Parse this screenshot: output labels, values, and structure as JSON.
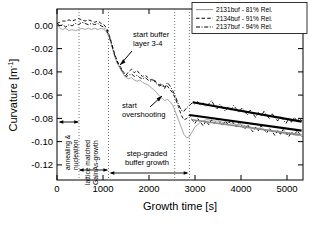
{
  "chart_data": {
    "type": "line",
    "title": "",
    "xlabel": "Growth time [s]",
    "ylabel": "Curvature [m-1]",
    "ylabel_base": "Curvature [m",
    "ylabel_sup": "-1",
    "ylabel_close": "]",
    "xlim": [
      0,
      5350
    ],
    "ylim": [
      -0.13,
      0.012
    ],
    "xticks": [
      0,
      1000,
      2000,
      3000,
      4000,
      5000
    ],
    "xtick_labels": [
      "0",
      "1000",
      "2000",
      "3000",
      "4000",
      "5000"
    ],
    "yticks": [
      0.0,
      -0.02,
      -0.04,
      -0.06,
      -0.08,
      -0.1,
      -0.12
    ],
    "ytick_labels": [
      "0.00",
      "-0.02",
      "-0.04",
      "-0.06",
      "-0.08",
      "-0.10",
      "-0.12"
    ],
    "grid": false,
    "legend_position": "top-right",
    "series": [
      {
        "name": "2131buf - 81% Rel.",
        "style": "solid",
        "color": "#9a9a9a",
        "width": 0.9,
        "points": [
          [
            0,
            0.0
          ],
          [
            60,
            -0.004
          ],
          [
            120,
            -0.005
          ],
          [
            190,
            -0.004
          ],
          [
            260,
            -0.006
          ],
          [
            330,
            -0.005
          ],
          [
            400,
            -0.006
          ],
          [
            470,
            -0.005
          ],
          [
            540,
            -0.004
          ],
          [
            610,
            -0.005
          ],
          [
            680,
            -0.004
          ],
          [
            750,
            -0.005
          ],
          [
            820,
            -0.004
          ],
          [
            890,
            -0.005
          ],
          [
            960,
            -0.004
          ],
          [
            1020,
            -0.005
          ],
          [
            1080,
            -0.007
          ],
          [
            1140,
            -0.012
          ],
          [
            1200,
            -0.02
          ],
          [
            1260,
            -0.028
          ],
          [
            1320,
            -0.034
          ],
          [
            1380,
            -0.038
          ],
          [
            1440,
            -0.042
          ],
          [
            1500,
            -0.045
          ],
          [
            1560,
            -0.046
          ],
          [
            1620,
            -0.045
          ],
          [
            1680,
            -0.047
          ],
          [
            1740,
            -0.048
          ],
          [
            1800,
            -0.047
          ],
          [
            1860,
            -0.049
          ],
          [
            1920,
            -0.05
          ],
          [
            1980,
            -0.051
          ],
          [
            2040,
            -0.053
          ],
          [
            2100,
            -0.055
          ],
          [
            2160,
            -0.057
          ],
          [
            2220,
            -0.06
          ],
          [
            2280,
            -0.062
          ],
          [
            2340,
            -0.064
          ],
          [
            2400,
            -0.063
          ],
          [
            2460,
            -0.065
          ],
          [
            2520,
            -0.068
          ],
          [
            2580,
            -0.074
          ],
          [
            2640,
            -0.08
          ],
          [
            2700,
            -0.086
          ],
          [
            2760,
            -0.092
          ],
          [
            2820,
            -0.095
          ],
          [
            2880,
            -0.094
          ],
          [
            2940,
            -0.09
          ],
          [
            3000,
            -0.086
          ],
          [
            3060,
            -0.084
          ],
          [
            3120,
            -0.082
          ],
          [
            3180,
            -0.081
          ],
          [
            3240,
            -0.08
          ],
          [
            3300,
            -0.08
          ],
          [
            3400,
            -0.081
          ],
          [
            3500,
            -0.081
          ],
          [
            3600,
            -0.082
          ],
          [
            3700,
            -0.082
          ],
          [
            3800,
            -0.083
          ],
          [
            3900,
            -0.084
          ],
          [
            4000,
            -0.084
          ],
          [
            4100,
            -0.085
          ],
          [
            4200,
            -0.086
          ],
          [
            4300,
            -0.087
          ],
          [
            4400,
            -0.087
          ],
          [
            4500,
            -0.088
          ],
          [
            4600,
            -0.089
          ],
          [
            4700,
            -0.09
          ],
          [
            4800,
            -0.09
          ],
          [
            4900,
            -0.091
          ],
          [
            5000,
            -0.092
          ],
          [
            5100,
            -0.092
          ],
          [
            5200,
            -0.093
          ],
          [
            5300,
            -0.093
          ]
        ]
      },
      {
        "name": "2134buf - 91% Rel.",
        "style": "dashed",
        "color": "#000000",
        "width": 0.9,
        "points": [
          [
            0,
            0.0
          ],
          [
            60,
            0.001
          ],
          [
            120,
            0.002
          ],
          [
            190,
            0.002
          ],
          [
            260,
            0.003
          ],
          [
            330,
            0.002
          ],
          [
            400,
            0.003
          ],
          [
            470,
            0.004
          ],
          [
            540,
            0.003
          ],
          [
            610,
            0.002
          ],
          [
            680,
            0.003
          ],
          [
            750,
            0.002
          ],
          [
            820,
            0.001
          ],
          [
            890,
            0.002
          ],
          [
            960,
            0.0
          ],
          [
            1020,
            -0.001
          ],
          [
            1080,
            -0.004
          ],
          [
            1140,
            -0.01
          ],
          [
            1200,
            -0.018
          ],
          [
            1260,
            -0.026
          ],
          [
            1320,
            -0.032
          ],
          [
            1380,
            -0.036
          ],
          [
            1440,
            -0.04
          ],
          [
            1500,
            -0.043
          ],
          [
            1560,
            -0.04
          ],
          [
            1620,
            -0.038
          ],
          [
            1680,
            -0.041
          ],
          [
            1740,
            -0.039
          ],
          [
            1800,
            -0.042
          ],
          [
            1860,
            -0.044
          ],
          [
            1920,
            -0.043
          ],
          [
            1980,
            -0.045
          ],
          [
            2040,
            -0.047
          ],
          [
            2100,
            -0.046
          ],
          [
            2160,
            -0.049
          ],
          [
            2220,
            -0.051
          ],
          [
            2280,
            -0.05
          ],
          [
            2340,
            -0.053
          ],
          [
            2400,
            -0.052
          ],
          [
            2460,
            -0.055
          ],
          [
            2520,
            -0.058
          ],
          [
            2580,
            -0.063
          ],
          [
            2640,
            -0.069
          ],
          [
            2700,
            -0.076
          ],
          [
            2760,
            -0.08
          ],
          [
            2820,
            -0.079
          ],
          [
            2880,
            -0.076
          ],
          [
            2940,
            -0.08
          ],
          [
            3000,
            -0.083
          ],
          [
            3060,
            -0.079
          ],
          [
            3120,
            -0.082
          ],
          [
            3180,
            -0.085
          ],
          [
            3240,
            -0.081
          ],
          [
            3300,
            -0.084
          ],
          [
            3360,
            -0.08
          ],
          [
            3420,
            -0.083
          ],
          [
            3480,
            -0.079
          ],
          [
            3540,
            -0.082
          ],
          [
            3600,
            -0.085
          ],
          [
            3660,
            -0.081
          ],
          [
            3720,
            -0.084
          ],
          [
            3780,
            -0.08
          ],
          [
            3840,
            -0.083
          ],
          [
            3900,
            -0.086
          ],
          [
            3960,
            -0.082
          ],
          [
            4020,
            -0.085
          ],
          [
            4080,
            -0.088
          ],
          [
            4140,
            -0.084
          ],
          [
            4200,
            -0.087
          ],
          [
            4260,
            -0.09
          ],
          [
            4320,
            -0.086
          ],
          [
            4380,
            -0.089
          ],
          [
            4440,
            -0.085
          ],
          [
            4500,
            -0.088
          ],
          [
            4560,
            -0.091
          ],
          [
            4620,
            -0.087
          ],
          [
            4680,
            -0.09
          ],
          [
            4740,
            -0.093
          ],
          [
            4800,
            -0.089
          ],
          [
            4860,
            -0.092
          ],
          [
            4920,
            -0.088
          ],
          [
            4980,
            -0.091
          ],
          [
            5040,
            -0.094
          ],
          [
            5100,
            -0.09
          ],
          [
            5160,
            -0.093
          ],
          [
            5220,
            -0.089
          ],
          [
            5280,
            -0.092
          ],
          [
            5330,
            -0.094
          ]
        ]
      },
      {
        "name": "2137buf - 94% Rel.",
        "style": "dashdot",
        "color": "#000000",
        "width": 0.9,
        "points": [
          [
            0,
            0.0
          ],
          [
            60,
            -0.002
          ],
          [
            120,
            -0.001
          ],
          [
            190,
            -0.003
          ],
          [
            260,
            -0.001
          ],
          [
            330,
            -0.002
          ],
          [
            400,
            0.0
          ],
          [
            470,
            -0.001
          ],
          [
            540,
            0.001
          ],
          [
            610,
            0.0
          ],
          [
            680,
            -0.001
          ],
          [
            750,
            0.0
          ],
          [
            820,
            -0.001
          ],
          [
            890,
            0.0
          ],
          [
            960,
            -0.002
          ],
          [
            1020,
            -0.003
          ],
          [
            1080,
            -0.006
          ],
          [
            1140,
            -0.011
          ],
          [
            1200,
            -0.019
          ],
          [
            1260,
            -0.027
          ],
          [
            1320,
            -0.033
          ],
          [
            1380,
            -0.037
          ],
          [
            1440,
            -0.041
          ],
          [
            1500,
            -0.044
          ],
          [
            1560,
            -0.043
          ],
          [
            1620,
            -0.042
          ],
          [
            1680,
            -0.044
          ],
          [
            1740,
            -0.043
          ],
          [
            1800,
            -0.045
          ],
          [
            1860,
            -0.046
          ],
          [
            1920,
            -0.045
          ],
          [
            1980,
            -0.047
          ],
          [
            2040,
            -0.048
          ],
          [
            2100,
            -0.047
          ],
          [
            2160,
            -0.05
          ],
          [
            2220,
            -0.052
          ],
          [
            2280,
            -0.051
          ],
          [
            2340,
            -0.054
          ],
          [
            2400,
            -0.049
          ],
          [
            2460,
            -0.052
          ],
          [
            2520,
            -0.056
          ],
          [
            2580,
            -0.061
          ],
          [
            2640,
            -0.067
          ],
          [
            2700,
            -0.072
          ],
          [
            2760,
            -0.073
          ],
          [
            2820,
            -0.07
          ],
          [
            2880,
            -0.068
          ],
          [
            2940,
            -0.066
          ],
          [
            3000,
            -0.067
          ],
          [
            3060,
            -0.065
          ],
          [
            3120,
            -0.068
          ],
          [
            3180,
            -0.066
          ],
          [
            3240,
            -0.069
          ],
          [
            3300,
            -0.067
          ],
          [
            3360,
            -0.064
          ],
          [
            3420,
            -0.068
          ],
          [
            3480,
            -0.071
          ],
          [
            3540,
            -0.067
          ],
          [
            3600,
            -0.07
          ],
          [
            3660,
            -0.073
          ],
          [
            3720,
            -0.069
          ],
          [
            3780,
            -0.072
          ],
          [
            3840,
            -0.068
          ],
          [
            3900,
            -0.071
          ],
          [
            3960,
            -0.074
          ],
          [
            4020,
            -0.07
          ],
          [
            4080,
            -0.073
          ],
          [
            4140,
            -0.076
          ],
          [
            4200,
            -0.072
          ],
          [
            4260,
            -0.075
          ],
          [
            4320,
            -0.078
          ],
          [
            4380,
            -0.074
          ],
          [
            4440,
            -0.077
          ],
          [
            4500,
            -0.073
          ],
          [
            4560,
            -0.076
          ],
          [
            4620,
            -0.079
          ],
          [
            4680,
            -0.075
          ],
          [
            4740,
            -0.078
          ],
          [
            4800,
            -0.081
          ],
          [
            4860,
            -0.077
          ],
          [
            4920,
            -0.08
          ],
          [
            4980,
            -0.083
          ],
          [
            5040,
            -0.079
          ],
          [
            5100,
            -0.082
          ],
          [
            5160,
            -0.078
          ],
          [
            5220,
            -0.081
          ],
          [
            5280,
            -0.079
          ],
          [
            5330,
            -0.081
          ]
        ]
      }
    ],
    "trend_lines": [
      {
        "name": "trend-upper",
        "x0": 2950,
        "y0": -0.0655,
        "x1": 5320,
        "y1": -0.0815,
        "color": "#000000",
        "width": 2.1
      },
      {
        "name": "trend-lower",
        "x0": 2880,
        "y0": -0.076,
        "x1": 5320,
        "y1": -0.089,
        "color": "#000000",
        "width": 2.1
      },
      {
        "name": "trend-gray",
        "x0": 2930,
        "y0": -0.08,
        "x1": 5320,
        "y1": -0.0925,
        "color": "#8c8c8c",
        "width": 1.6
      }
    ],
    "vlines": [
      480,
      1120,
      2560,
      2880
    ],
    "annotations": [
      {
        "name": "start-buffer-layer",
        "line1": "start buffer",
        "line2": "layer 3-4"
      },
      {
        "name": "start-overshooting",
        "line1": "start",
        "line2": "overshooting"
      },
      {
        "name": "annealing-nucleation",
        "line1": "annealing &",
        "line2": "nucleation"
      },
      {
        "name": "lattice-matched",
        "line1": "lattice matched",
        "line2": "GaInAs-growth"
      },
      {
        "name": "step-graded",
        "line1": "step-graded",
        "line2": "buffer growth"
      }
    ]
  }
}
